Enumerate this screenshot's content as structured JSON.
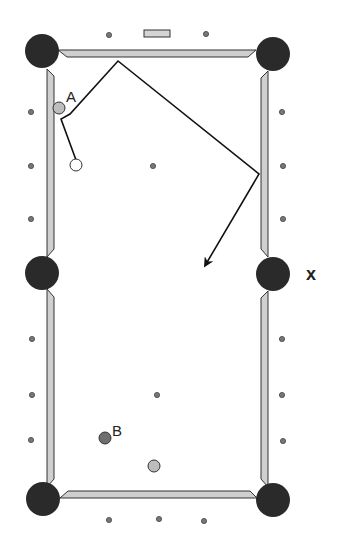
{
  "diagram": {
    "type": "billiard-table-shot",
    "labels": {
      "ball_a": "A",
      "ball_b": "B",
      "pocket_target": "X"
    },
    "colors": {
      "background": "#ffffff",
      "pocket": "#2a2a2a",
      "rail_fill": "#cfcfcf",
      "rail_stroke": "#333333",
      "diamond": "#777777",
      "object_ball_light": "#bdbdbd",
      "object_ball_dark": "#6e6e6e",
      "cue_ball": "#ffffff",
      "path": "#111111"
    },
    "pockets": [
      {
        "name": "top-left",
        "x": 42,
        "y": 51
      },
      {
        "name": "top-right",
        "x": 273,
        "y": 54
      },
      {
        "name": "mid-left",
        "x": 42,
        "y": 273
      },
      {
        "name": "mid-right",
        "x": 273,
        "y": 274
      },
      {
        "name": "bottom-left",
        "x": 43,
        "y": 499
      },
      {
        "name": "bottom-right",
        "x": 273,
        "y": 500
      }
    ],
    "balls": [
      {
        "name": "ball-a",
        "x": 59,
        "y": 108,
        "r": 6,
        "color": "#bdbdbd"
      },
      {
        "name": "cue-ball",
        "x": 76,
        "y": 165,
        "r": 6,
        "color": "#ffffff"
      },
      {
        "name": "ball-b",
        "x": 105,
        "y": 438,
        "r": 6,
        "color": "#6e6e6e"
      },
      {
        "name": "ball-light",
        "x": 154,
        "y": 466,
        "r": 6,
        "color": "#bdbdbd"
      }
    ],
    "diamonds": [
      {
        "x": 109,
        "y": 35
      },
      {
        "x": 206,
        "y": 34
      },
      {
        "x": 31,
        "y": 112
      },
      {
        "x": 282,
        "y": 112
      },
      {
        "x": 31,
        "y": 166
      },
      {
        "x": 283,
        "y": 166
      },
      {
        "x": 31,
        "y": 219
      },
      {
        "x": 283,
        "y": 219
      },
      {
        "x": 32,
        "y": 339
      },
      {
        "x": 282,
        "y": 339
      },
      {
        "x": 32,
        "y": 395
      },
      {
        "x": 282,
        "y": 395
      },
      {
        "x": 31,
        "y": 440
      },
      {
        "x": 283,
        "y": 441
      },
      {
        "x": 109,
        "y": 520
      },
      {
        "x": 159,
        "y": 519
      },
      {
        "x": 204,
        "y": 521
      }
    ],
    "spots": [
      {
        "x": 153,
        "y": 166
      },
      {
        "x": 157,
        "y": 395
      }
    ],
    "head_marker": {
      "x": 144,
      "y": 30,
      "w": 26,
      "h": 8
    },
    "shot_path": "76,160 61,119 70,114 118,61 259,174 206,264"
  }
}
